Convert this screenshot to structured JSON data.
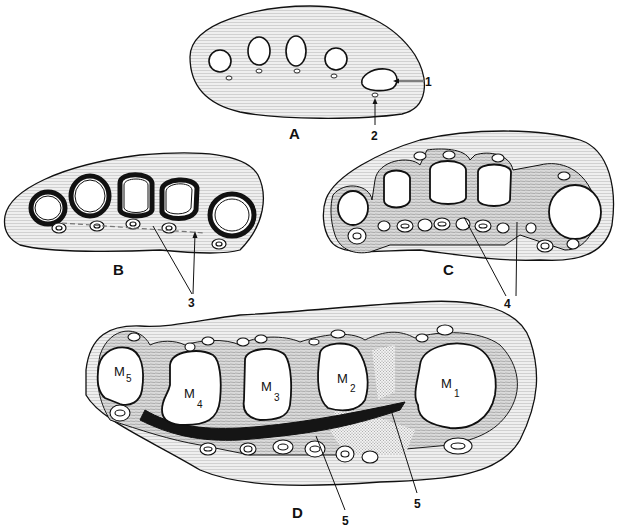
{
  "figure": {
    "type": "anatomical cross-section diagram",
    "colors": {
      "background": "#ffffff",
      "tissue_fill": "#e6e6e6",
      "outline": "#111111",
      "bone_fill": "#ffffff",
      "stipple": "#bdbdbd",
      "dense_band": "#1a1a1a"
    },
    "panels": [
      {
        "id": "A",
        "label": "A",
        "callouts": [
          {
            "label": "1"
          },
          {
            "label": "2"
          }
        ]
      },
      {
        "id": "B",
        "label": "B",
        "callouts": [
          {
            "label": "3"
          }
        ]
      },
      {
        "id": "C",
        "label": "C",
        "callouts": [
          {
            "label": "4"
          }
        ]
      },
      {
        "id": "D",
        "label": "D",
        "callouts": [
          {
            "label": "5"
          },
          {
            "label": "5"
          }
        ],
        "bones": [
          {
            "letter": "M",
            "sub": "5"
          },
          {
            "letter": "M",
            "sub": "4"
          },
          {
            "letter": "M",
            "sub": "3"
          },
          {
            "letter": "M",
            "sub": "2"
          },
          {
            "letter": "M",
            "sub": "1"
          }
        ]
      }
    ],
    "callout_labels": {
      "c1": "1",
      "c2": "2",
      "c3": "3",
      "c4": "4",
      "c5a": "5",
      "c5b": "5"
    }
  }
}
